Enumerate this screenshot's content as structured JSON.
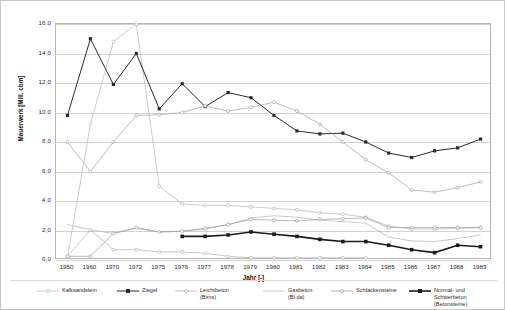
{
  "chart_data": {
    "type": "line",
    "title": "",
    "xlabel": "Jahr [-]",
    "ylabel": "Mauerwerk [Mill. cbm]",
    "ylim": [
      0.0,
      16.0
    ],
    "yticks": [
      "0,0",
      "2,0",
      "4,0",
      "6,0",
      "8,0",
      "10,0",
      "12,0",
      "14,0",
      "16,0"
    ],
    "ytick_values": [
      0.0,
      2.0,
      4.0,
      6.0,
      8.0,
      10.0,
      12.0,
      14.0,
      16.0
    ],
    "grid": true,
    "legend_position": "bottom",
    "categories": [
      "1950",
      "1960",
      "1970",
      "1972",
      "1975",
      "1976",
      "1977",
      "1978",
      "1979",
      "1980",
      "1981",
      "1982",
      "1983",
      "1984",
      "1985",
      "1986",
      "1987",
      "1988",
      "1989"
    ],
    "series": [
      {
        "name": "Kalksandstein",
        "color": "#b6b6b6",
        "marker": "circle",
        "weight": 0.7,
        "values": [
          0.2,
          9.2,
          14.8,
          16.0,
          5.0,
          3.8,
          3.7,
          3.7,
          3.6,
          3.5,
          3.4,
          3.2,
          3.1,
          2.9,
          2.3,
          2.1,
          2.1,
          2.15,
          2.2
        ]
      },
      {
        "name": "Ziegel",
        "color": "#2a2a2a",
        "marker": "square",
        "weight": 1.0,
        "values": [
          9.8,
          15.0,
          11.9,
          14.0,
          10.25,
          11.95,
          10.4,
          11.35,
          11.0,
          9.8,
          8.75,
          8.55,
          8.6,
          8.0,
          7.25,
          6.95,
          7.4,
          7.6,
          8.2
        ]
      },
      {
        "name": "Leichtbeton (Bims)",
        "color": "#a0a0a0",
        "marker": "circle",
        "weight": 0.7,
        "values": [
          8.0,
          6.0,
          8.0,
          9.8,
          9.85,
          10.0,
          10.45,
          10.1,
          10.35,
          10.7,
          10.1,
          9.2,
          8.0,
          6.8,
          5.9,
          4.75,
          4.6,
          4.9,
          5.3
        ]
      },
      {
        "name": "Gasbeton (Bl.da)",
        "color": "#b0b0b0",
        "marker": "none",
        "weight": 0.7,
        "values": [
          2.4,
          2.05,
          1.8,
          2.15,
          1.9,
          1.95,
          2.1,
          2.4,
          2.85,
          3.0,
          2.9,
          2.7,
          2.6,
          2.5,
          1.55,
          1.3,
          1.25,
          1.45,
          1.7
        ]
      },
      {
        "name": "Schlackensteine",
        "color": "#9a9a9a",
        "marker": "circle",
        "weight": 0.7,
        "values": [
          0.25,
          0.25,
          1.8,
          2.2,
          1.9,
          1.95,
          2.15,
          2.4,
          2.75,
          2.7,
          2.65,
          2.75,
          2.8,
          2.85,
          2.2,
          2.2,
          2.2,
          2.2,
          2.2
        ]
      },
      {
        "name": "Normal- und Schwerbeton\n(Betonsteine)",
        "color": "#1a1a1a",
        "marker": "square",
        "weight": 1.6,
        "values": [
          null,
          null,
          null,
          null,
          null,
          1.6,
          1.6,
          1.7,
          1.9,
          1.75,
          1.6,
          1.4,
          1.25,
          1.25,
          1.0,
          0.7,
          0.5,
          1.0,
          0.9
        ]
      },
      {
        "name": "_minor",
        "color": "#b0b0b0",
        "marker": "circle",
        "weight": 0.7,
        "hidden_legend": true,
        "values": [
          0.25,
          2.05,
          0.7,
          0.7,
          0.55,
          0.55,
          0.45,
          0.25,
          0.15,
          0.15,
          0.15,
          0.15,
          0.15,
          0.15,
          null,
          null,
          null,
          null,
          null
        ]
      }
    ]
  },
  "legend": {
    "items": [
      {
        "label": "Kalksandstein",
        "color": "#b6b6b6",
        "marker": "circle",
        "weight": 0.7,
        "x": 36
      },
      {
        "label": "Ziegel",
        "color": "#2a2a2a",
        "marker": "square",
        "weight": 1.0,
        "x": 116
      },
      {
        "label": "Leichtbeton (Bims)",
        "color": "#a0a0a0",
        "marker": "circle",
        "weight": 0.7,
        "x": 174
      },
      {
        "label": "Gasbeton (Bl.da)",
        "color": "#b0b0b0",
        "marker": "none",
        "weight": 0.7,
        "x": 262
      },
      {
        "label": "Schlackensteine",
        "color": "#9a9a9a",
        "marker": "circle",
        "weight": 0.7,
        "x": 330
      },
      {
        "label": "Normal- und Schwerbeton\n(Betonsteine)",
        "color": "#1a1a1a",
        "marker": "square",
        "weight": 1.6,
        "x": 408
      }
    ]
  }
}
